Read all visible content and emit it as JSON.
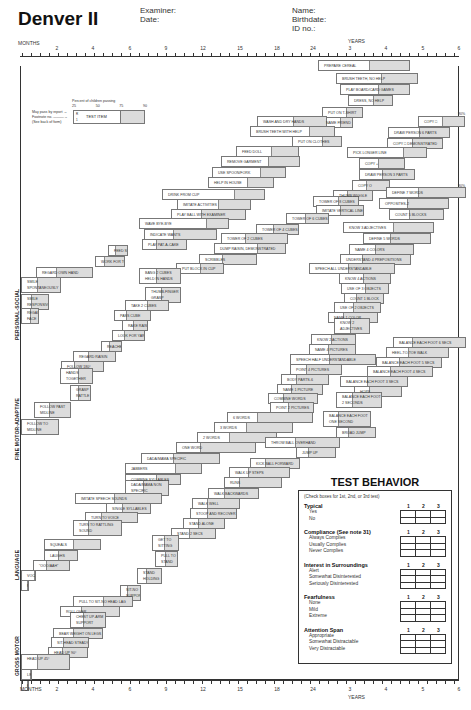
{
  "header": {
    "title": "Denver II",
    "examiner_label": "Examiner:",
    "date_label": "Date:",
    "name_label": "Name:",
    "birthdate_label": "Birthdate:",
    "id_label": "ID no.:"
  },
  "axis": {
    "months_label": "MONTHS",
    "years_label": "YEARS",
    "month_ticks": [
      "2",
      "4",
      "6",
      "9",
      "12",
      "15",
      "18",
      "24"
    ],
    "year_ticks": [
      "3",
      "4",
      "5",
      "6"
    ]
  },
  "legend": {
    "percent_title": "Percent of children passing",
    "percent_ticks": [
      "25",
      "50",
      "75",
      "90"
    ],
    "may_pass": "May pass by report →",
    "footnote": "Footnote no. ———→",
    "see_back": "(See back of form)",
    "code_r": "R",
    "code_1": "1",
    "test_item": "TEST ITEM"
  },
  "sections": {
    "personal_social": "PERSONAL-SOCIAL",
    "fine_motor": "FINE MOTOR-ADAPTIVE",
    "language": "LANGUAGE",
    "gross_motor": "GROSS MOTOR"
  },
  "pct_marker": "90%",
  "items": {
    "personal_social": [
      {
        "label": "PREPARE CEREAL",
        "x": 318,
        "y": 60,
        "w": 92,
        "f": 0.55
      },
      {
        "label": "BRUSH TEETH, NO HELP",
        "x": 336,
        "y": 73,
        "w": 82,
        "f": 0.55
      },
      {
        "label": "PLAY BOARD/CARD GAMES",
        "x": 340,
        "y": 84,
        "w": 70,
        "f": 0.55
      },
      {
        "label": "DRESS, NO HELP",
        "x": 348,
        "y": 95,
        "w": 45,
        "f": 0.55
      },
      {
        "label": "PUT ON T-SHIRT",
        "x": 322,
        "y": 107,
        "w": 41,
        "f": 0.6
      },
      {
        "label": "NAME FRIEND",
        "x": 320,
        "y": 117,
        "w": 33,
        "f": 0.6
      },
      {
        "label": "WASH AND DRY HANDS",
        "x": 257,
        "y": 116,
        "w": 70,
        "f": 0.52
      },
      {
        "label": "BRUSH TEETH WITH HELP",
        "x": 250,
        "y": 126,
        "w": 85,
        "f": 0.7
      },
      {
        "label": "PUT ON CLOTHES",
        "x": 292,
        "y": 136,
        "w": 50,
        "f": 0.6
      },
      {
        "label": "FEED DOLL",
        "x": 236,
        "y": 146,
        "w": 63,
        "f": 0.55
      },
      {
        "label": "REMOVE GARMENT",
        "x": 221,
        "y": 156,
        "w": 79,
        "f": 0.6
      },
      {
        "label": "USE SPOON/FORK",
        "x": 212,
        "y": 167,
        "w": 74,
        "f": 0.65
      },
      {
        "label": "HELP IN HOUSE",
        "x": 208,
        "y": 177,
        "w": 66,
        "f": 0.6
      },
      {
        "label": "DRINK FROM CUP",
        "x": 162,
        "y": 189,
        "w": 103,
        "f": 0.7
      },
      {
        "label": "IMITATE ACTIVITIES",
        "x": 177,
        "y": 199,
        "w": 74,
        "f": 0.55
      },
      {
        "label": "PLAY BALL WITH EXAMINER",
        "x": 171,
        "y": 209,
        "w": 75,
        "f": 0.4
      },
      {
        "label": "WAVE BYE-BYE",
        "x": 139,
        "y": 218,
        "w": 90,
        "f": 0.75
      },
      {
        "label": "INDICATE WANTS",
        "x": 144,
        "y": 229,
        "w": 73,
        "f": 0.4
      },
      {
        "label": "PLAY PAT-A-CAKE",
        "x": 142,
        "y": 239,
        "w": 45,
        "f": 0.3
      },
      {
        "label": "FEED SELF",
        "x": 108,
        "y": 245,
        "w": 20,
        "f": 0.35
      },
      {
        "label": "WORK FOR TOY",
        "x": 95,
        "y": 256,
        "w": 30,
        "f": 0.3
      },
      {
        "label": "REGARD OWN HAND",
        "x": 36,
        "y": 267,
        "w": 57,
        "f": 0.35
      },
      {
        "label": "SMILE SPONTANEOUSLY",
        "x": 21,
        "y": 277,
        "w": 40,
        "f": 0.4,
        "tall": true
      },
      {
        "label": "SMILE RESPONSIVELY",
        "x": 21,
        "y": 294,
        "w": 28,
        "f": 0.35,
        "tall": true
      },
      {
        "label": "REGARD FACE",
        "x": 21,
        "y": 308,
        "w": 18,
        "f": 0.5,
        "tall": true
      }
    ],
    "fine_motor": [
      {
        "label": "COPY □",
        "x": 418,
        "y": 116,
        "w": 47,
        "f": 0.5
      },
      {
        "label": "DRAW PERSON 6 PARTS",
        "x": 388,
        "y": 127,
        "w": 62,
        "f": 0.5
      },
      {
        "label": "COPY □ DEMONSTRATED",
        "x": 387,
        "y": 138,
        "w": 56,
        "f": 0.45
      },
      {
        "label": "PICK LONGER LINE",
        "x": 347,
        "y": 147,
        "w": 80,
        "f": 0.7
      },
      {
        "label": "COPY +",
        "x": 359,
        "y": 158,
        "w": 46,
        "f": 0.4
      },
      {
        "label": "DRAW PERSON 3 PARTS",
        "x": 359,
        "y": 169,
        "w": 56,
        "f": 0.4
      },
      {
        "label": "COPY O",
        "x": 352,
        "y": 180,
        "w": 38,
        "f": 0.35
      },
      {
        "label": "THUMB WIGGLE",
        "x": 333,
        "y": 190,
        "w": 40,
        "f": 0.35
      },
      {
        "label": "TOWER OF 8 CUBES",
        "x": 313,
        "y": 196,
        "w": 46,
        "f": 0.55
      },
      {
        "label": "IMITATE VERTICAL LINE",
        "x": 316,
        "y": 205,
        "w": 48,
        "f": 0.5
      },
      {
        "label": "TOWER OF 6 CUBES",
        "x": 286,
        "y": 213,
        "w": 43,
        "f": 0.45
      },
      {
        "label": "TOWER OF 4 CUBES",
        "x": 256,
        "y": 224,
        "w": 43,
        "f": 0.4
      },
      {
        "label": "TOWER OF 2 CUBES",
        "x": 221,
        "y": 233,
        "w": 67,
        "f": 0.35
      },
      {
        "label": "DUMP RAISIN, DEMONSTRATED",
        "x": 214,
        "y": 243,
        "w": 72,
        "f": 0.6
      },
      {
        "label": "SCRIBBLES",
        "x": 199,
        "y": 254,
        "w": 58,
        "f": 0.4
      },
      {
        "label": "PUT BLOCK IN CUP",
        "x": 176,
        "y": 263,
        "w": 48,
        "f": 0.5
      },
      {
        "label": "BANG 2 CUBES HELD IN HANDS",
        "x": 139,
        "y": 268,
        "w": 42,
        "f": 0.4,
        "tall": true
      },
      {
        "label": "THUMB-FINGER GRASP",
        "x": 145,
        "y": 287,
        "w": 36,
        "f": 0.45,
        "tall": true
      },
      {
        "label": "TAKE 2 CUBES",
        "x": 125,
        "y": 300,
        "w": 44,
        "f": 0.5
      },
      {
        "label": "PASS CUBE",
        "x": 114,
        "y": 310,
        "w": 37,
        "f": 0.3
      },
      {
        "label": "RAKE RAISIN",
        "x": 122,
        "y": 320,
        "w": 26,
        "f": 0.4
      },
      {
        "label": "LOOK FOR YARN",
        "x": 112,
        "y": 330,
        "w": 33,
        "f": 0.35
      },
      {
        "label": "REACHES",
        "x": 101,
        "y": 341,
        "w": 21,
        "f": 0.35
      },
      {
        "label": "REGARD RAISIN",
        "x": 73,
        "y": 351,
        "w": 43,
        "f": 0.35
      },
      {
        "label": "FOLLOW 180°",
        "x": 61,
        "y": 361,
        "w": 43,
        "f": 0.3
      },
      {
        "label": "HANDS TOGETHER",
        "x": 60,
        "y": 368,
        "w": 33,
        "f": 0.55,
        "tall": true
      },
      {
        "label": "GRASP RATTLE",
        "x": 70,
        "y": 385,
        "w": 21,
        "f": 0.35,
        "tall": true
      },
      {
        "label": "FOLLOW PAST MIDLINE",
        "x": 34,
        "y": 402,
        "w": 37,
        "f": 0.4,
        "tall": true
      },
      {
        "label": "FOLLOW TO MIDLINE",
        "x": 21,
        "y": 419,
        "w": 38,
        "f": 0.4,
        "tall": true
      }
    ],
    "language": [
      {
        "label": "DEFINE 7 WORDS",
        "x": 386,
        "y": 187,
        "w": 80,
        "f": 0.4
      },
      {
        "label": "OPPOSITES-2",
        "x": 379,
        "y": 198,
        "w": 70,
        "f": 0.4
      },
      {
        "label": "COUNT 5 BLOCKS",
        "x": 389,
        "y": 209,
        "w": 55,
        "f": 0.35
      },
      {
        "label": "KNOW 3 ADJECTIVES",
        "x": 343,
        "y": 222,
        "w": 91,
        "f": 0.55
      },
      {
        "label": "DEFINE 5 WORDS",
        "x": 363,
        "y": 233,
        "w": 68,
        "f": 0.4
      },
      {
        "label": "NAME 4 COLORS",
        "x": 349,
        "y": 244,
        "w": 65,
        "f": 0.4
      },
      {
        "label": "UNDERSTAND 4 PREPOSITIONS",
        "x": 340,
        "y": 254,
        "w": 71,
        "f": 0.3
      },
      {
        "label": "SPEECH ALL UNDERSTANDABLE",
        "x": 309,
        "y": 263,
        "w": 86,
        "f": 0.45
      },
      {
        "label": "KNOW 4 ACTIONS",
        "x": 339,
        "y": 273,
        "w": 52,
        "f": 0.45
      },
      {
        "label": "USE OF 3 OBJECTS",
        "x": 341,
        "y": 283,
        "w": 48,
        "f": 0.5
      },
      {
        "label": "COUNT 1 BLOCK",
        "x": 344,
        "y": 293,
        "w": 40,
        "f": 0.3
      },
      {
        "label": "USE OF 2 OBJECTS",
        "x": 334,
        "y": 302,
        "w": 47,
        "f": 0.4
      },
      {
        "label": "NAME 1 COLOR",
        "x": 328,
        "y": 312,
        "w": 50,
        "f": 0.3
      },
      {
        "label": "KNOW 2 ADJECTIVES",
        "x": 334,
        "y": 318,
        "w": 36,
        "f": 0.45,
        "tall": true
      },
      {
        "label": "KNOW 2 ACTIONS",
        "x": 311,
        "y": 334,
        "w": 45,
        "f": 0.45
      },
      {
        "label": "NAME 4 PICTURES",
        "x": 309,
        "y": 344,
        "w": 47,
        "f": 0.4
      },
      {
        "label": "SPEECH HALF UNDERSTANDABLE",
        "x": 290,
        "y": 354,
        "w": 86,
        "f": 0.45
      },
      {
        "label": "POINT 4 PICTURES",
        "x": 290,
        "y": 364,
        "w": 52,
        "f": 0.3
      },
      {
        "label": "BODY PARTS-6",
        "x": 281,
        "y": 374,
        "w": 48,
        "f": 0.3
      },
      {
        "label": "NAME 1 PICTURE",
        "x": 277,
        "y": 384,
        "w": 46,
        "f": 0.3
      },
      {
        "label": "COMBINE WORDS",
        "x": 268,
        "y": 393,
        "w": 50,
        "f": 0.3
      },
      {
        "label": "POINT 2 PICTURES",
        "x": 270,
        "y": 402,
        "w": 44,
        "f": 0.4
      },
      {
        "label": "6 WORDS",
        "x": 227,
        "y": 412,
        "w": 86,
        "f": 0.35
      },
      {
        "label": "3 WORDS",
        "x": 214,
        "y": 422,
        "w": 79,
        "f": 0.4
      },
      {
        "label": "2 WORDS",
        "x": 197,
        "y": 432,
        "w": 80,
        "f": 0.4
      },
      {
        "label": "ONE WORD",
        "x": 176,
        "y": 442,
        "w": 80,
        "f": 0.3
      },
      {
        "label": "DADA/MAMA SPECIFIC",
        "x": 141,
        "y": 453,
        "w": 79,
        "f": 0.4
      },
      {
        "label": "JABBERS",
        "x": 125,
        "y": 463,
        "w": 77,
        "f": 0.65
      },
      {
        "label": "COMBINE SYLLABLES",
        "x": 125,
        "y": 474,
        "w": 56,
        "f": 0.55
      },
      {
        "label": "DADA/MAMA NON SPECIFIC",
        "x": 125,
        "y": 480,
        "w": 44,
        "f": 0.4,
        "tall": true
      },
      {
        "label": "IMITATE SPEECH SOUNDS",
        "x": 75,
        "y": 493,
        "w": 87,
        "f": 0.45
      },
      {
        "label": "SINGLE SYLLABLES",
        "x": 106,
        "y": 503,
        "w": 45,
        "f": 0.35
      },
      {
        "label": "TURN TO VOICE",
        "x": 85,
        "y": 512,
        "w": 53,
        "f": 0.3
      },
      {
        "label": "TURN TO RATTLING SOUND",
        "x": 73,
        "y": 520,
        "w": 49,
        "f": 0.3,
        "tall": true
      },
      {
        "label": "SQUEALS",
        "x": 44,
        "y": 539,
        "w": 57,
        "f": 0.5
      },
      {
        "label": "LAUGHS",
        "x": 44,
        "y": 550,
        "w": 34,
        "f": 0.4
      },
      {
        "label": "\"OOO/AAH\"",
        "x": 33,
        "y": 560,
        "w": 37,
        "f": 0.35
      },
      {
        "label": "VOCALIZES",
        "x": 21,
        "y": 570,
        "w": 15,
        "f": 0.9
      },
      {
        "label": "RESPOND TO BELL",
        "x": 21,
        "y": 580,
        "w": 8,
        "f": 0.9
      }
    ],
    "gross_motor": [
      {
        "label": "BALANCE EACH FOOT 6 SECS",
        "x": 393,
        "y": 337,
        "w": 73,
        "f": 0.25
      },
      {
        "label": "HEEL-TO-TOE WALK",
        "x": 386,
        "y": 347,
        "w": 63,
        "f": 0.35
      },
      {
        "label": "BALANCE EACH FOOT 5 SECS",
        "x": 376,
        "y": 357,
        "w": 66,
        "f": 0.35
      },
      {
        "label": "BALANCE EACH FOOT 4 SECS",
        "x": 367,
        "y": 366,
        "w": 66,
        "f": 0.35
      },
      {
        "label": "BALANCE EACH FOOT 3 SECS",
        "x": 340,
        "y": 376,
        "w": 68,
        "f": 0.4
      },
      {
        "label": "HOPS",
        "x": 354,
        "y": 386,
        "w": 48,
        "f": 0.3
      },
      {
        "label": "BALANCE EACH FOOT 2 SECONDS",
        "x": 336,
        "y": 392,
        "w": 46,
        "f": 0.35,
        "tall": true
      },
      {
        "label": "BALANCE EACH FOOT ONE SECOND",
        "x": 323,
        "y": 411,
        "w": 48,
        "f": 0.3,
        "tall": true
      },
      {
        "label": "BROAD JUMP",
        "x": 336,
        "y": 427,
        "w": 40,
        "f": 0.3
      },
      {
        "label": "THROW BALL OVERHAND",
        "x": 265,
        "y": 437,
        "w": 75,
        "f": 0.4
      },
      {
        "label": "JUMP UP",
        "x": 296,
        "y": 447,
        "w": 40,
        "f": 0.3
      },
      {
        "label": "KICK BALL FORWARD",
        "x": 250,
        "y": 458,
        "w": 50,
        "f": 0.3
      },
      {
        "label": "WALK UP STEPS",
        "x": 229,
        "y": 467,
        "w": 61,
        "f": 0.3
      },
      {
        "label": "RUNS",
        "x": 224,
        "y": 477,
        "w": 58,
        "f": 0.25
      },
      {
        "label": "WALK BACKWARDS",
        "x": 208,
        "y": 488,
        "w": 51,
        "f": 0.3
      },
      {
        "label": "WALK WELL",
        "x": 192,
        "y": 498,
        "w": 48,
        "f": 0.3
      },
      {
        "label": "STOOP AND RECOVER",
        "x": 190,
        "y": 508,
        "w": 47,
        "f": 0.35
      },
      {
        "label": "STAND ALONE",
        "x": 183,
        "y": 518,
        "w": 42,
        "f": 0.35
      },
      {
        "label": "STAND 2 SECS",
        "x": 171,
        "y": 528,
        "w": 45,
        "f": 0.4
      },
      {
        "label": "GET TO SITTING",
        "x": 152,
        "y": 535,
        "w": 27,
        "f": 0.45,
        "tall": true
      },
      {
        "label": "PULL TO STAND",
        "x": 155,
        "y": 551,
        "w": 23,
        "f": 0.45,
        "tall": true
      },
      {
        "label": "STAND HOLDING ON",
        "x": 137,
        "y": 568,
        "w": 25,
        "f": 0.35,
        "tall": true
      },
      {
        "label": "SIT-NO SUPPORT",
        "x": 120,
        "y": 585,
        "w": 21,
        "f": 0.3,
        "tall": true
      },
      {
        "label": "PULL TO SIT-NO HEAD LAG",
        "x": 73,
        "y": 596,
        "w": 60,
        "f": 0.5
      },
      {
        "label": "ROLL OVER",
        "x": 60,
        "y": 606,
        "w": 60,
        "f": 0.35
      },
      {
        "label": "CHEST UP-ARM SUPPORT",
        "x": 70,
        "y": 612,
        "w": 36,
        "f": 0.35,
        "tall": true
      },
      {
        "label": "BEAR WEIGHT ON LEGS",
        "x": 53,
        "y": 628,
        "w": 50,
        "f": 0.4
      },
      {
        "label": "SIT-HEAD STEADY",
        "x": 51,
        "y": 637,
        "w": 38,
        "f": 0.3
      },
      {
        "label": "HEAD UP 90°",
        "x": 48,
        "y": 647,
        "w": 40,
        "f": 0.35
      },
      {
        "label": "HEAD UP 45°",
        "x": 21,
        "y": 654,
        "w": 49,
        "f": 0.32,
        "tall": true
      },
      {
        "label": "LIFT HEAD",
        "x": 21,
        "y": 669,
        "w": 11,
        "f": 0.9
      },
      {
        "label": "EQUAL MOVEMENTS",
        "x": 21,
        "y": 680,
        "w": 8,
        "f": 0.9
      }
    ]
  },
  "test_behavior": {
    "title": "TEST BEHAVIOR",
    "note": "(Check boxes for 1st, 2nd, or 3rd test)",
    "col_headers": [
      "1",
      "2",
      "3"
    ],
    "sections": [
      {
        "title": "Typical",
        "options": [
          "Yes",
          "No"
        ]
      },
      {
        "title": "Compliance (See note 31)",
        "options": [
          "Always Complies",
          "Usually Complies",
          "Never Complies"
        ]
      },
      {
        "title": "Interest in Surroundings",
        "options": [
          "Alert",
          "Somewhat Disinterested",
          "Seriously Disinterested"
        ]
      },
      {
        "title": "Fearfulness",
        "options": [
          "None",
          "Mild",
          "Extreme"
        ]
      },
      {
        "title": "Attention Span",
        "options": [
          "Appropriate",
          "Somewhat Distractable",
          "Very Distractable"
        ]
      }
    ]
  }
}
